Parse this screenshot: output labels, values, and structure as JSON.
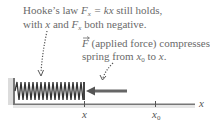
{
  "caption_top": {
    "line1_prefix": "Hooke’s law ",
    "line1_F": "F",
    "line1_sub": "x",
    "line1_eq": " = kx",
    "line1_suffix": " still holds,",
    "line2_prefix": "with ",
    "line2_x": "x",
    "line2_mid": " and ",
    "line2_F": "F",
    "line2_sub": "x",
    "line2_suffix": " both negative."
  },
  "caption_force": {
    "line1_F": "F",
    "line1_rest": " (applied force) compresses",
    "line2_prefix": "spring from ",
    "line2_x0": "x",
    "line2_x0_sub": "0",
    "line2_mid": " to ",
    "line2_x": "x",
    "line2_suffix": "."
  },
  "axis": {
    "label": "x",
    "tick_x_label": "x",
    "tick_x0_label": "x",
    "tick_x0_sub": "0"
  },
  "colors": {
    "text": "#6a6a6a",
    "spring": "#3a3a3a",
    "arrow": "#555555",
    "wall": "#b0b0b0",
    "axis": "#666666"
  }
}
